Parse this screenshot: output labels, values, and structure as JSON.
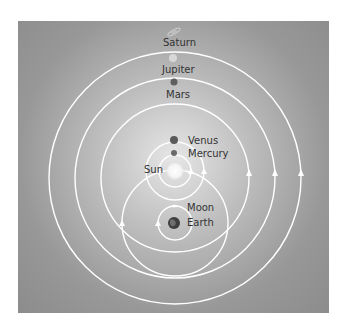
{
  "diagram": {
    "center_body": "Earth",
    "colors": {
      "background_center": "#e6e6e6",
      "background_edge": "#8c8c8c",
      "orbit": "#ffffff",
      "label": "#333333"
    },
    "bodies": [
      {
        "name": "Saturn",
        "label": "Saturn"
      },
      {
        "name": "Jupiter",
        "label": "Jupiter"
      },
      {
        "name": "Mars",
        "label": "Mars"
      },
      {
        "name": "Venus",
        "label": "Venus"
      },
      {
        "name": "Mercury",
        "label": "Mercury"
      },
      {
        "name": "Sun",
        "label": "Sun"
      },
      {
        "name": "Moon",
        "label": "Moon"
      },
      {
        "name": "Earth",
        "label": "Earth"
      }
    ]
  }
}
